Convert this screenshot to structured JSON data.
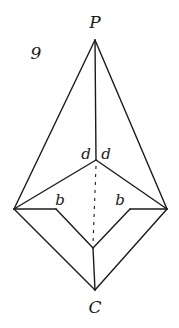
{
  "figure": {
    "number": "9",
    "labels": {
      "apex": "P",
      "bottom": "C",
      "angle_left": "d",
      "angle_right": "d",
      "side_left": "b",
      "side_right": "b"
    },
    "colors": {
      "ink": "#1a1a1a",
      "background": "#ffffff"
    },
    "vertices": {
      "P": [
        95,
        40
      ],
      "center_upper": [
        96,
        160
      ],
      "left": [
        14,
        209
      ],
      "right": [
        167,
        209
      ],
      "left_inner": [
        56,
        209
      ],
      "right_inner": [
        130,
        209
      ],
      "center_lower": [
        93,
        248
      ],
      "C": [
        95,
        290
      ]
    }
  }
}
